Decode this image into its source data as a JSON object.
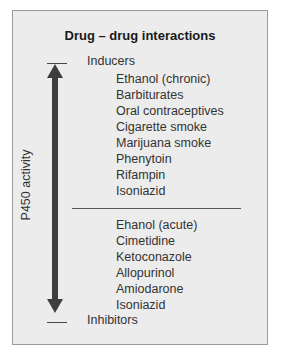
{
  "title": "Drug – drug interactions",
  "axis": {
    "label": "P450 activity",
    "top_label": "Inducers",
    "bottom_label": "Inhibitors"
  },
  "inducers": [
    "Ethanol (chronic)",
    "Barbiturates",
    "Oral contraceptives",
    "Cigarette smoke",
    "Marijuana smoke",
    "Phenytoin",
    "Rifampin",
    "Isoniazid"
  ],
  "inhibitors": [
    "Ehanol (acute)",
    "Cimetidine",
    "Ketoconazole",
    "Allopurinol",
    "Amiodarone",
    "Isoniazid"
  ],
  "colors": {
    "panel_bg": "#ececec",
    "border": "#9a9a9a",
    "arrow": "#3d3d3d",
    "text": "#333333"
  }
}
